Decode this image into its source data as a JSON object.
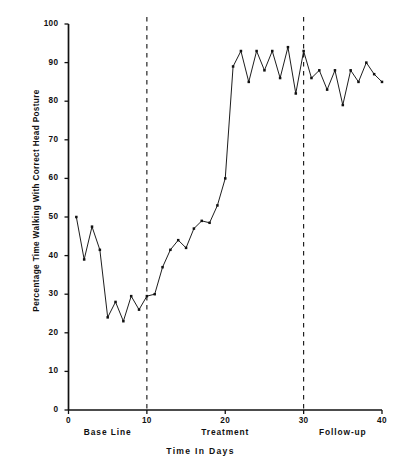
{
  "chart_data": {
    "type": "line",
    "title": "",
    "xlabel": "Time In Days",
    "ylabel": "Percentage Time Walking With Correct Head Posture",
    "xlim": [
      0,
      40
    ],
    "ylim": [
      0,
      100
    ],
    "xticks": [
      0,
      10,
      20,
      30,
      40
    ],
    "yticks": [
      0,
      10,
      20,
      30,
      40,
      50,
      60,
      70,
      80,
      90,
      100
    ],
    "grid": false,
    "legend": null,
    "line_color": "#111111",
    "marker": "square",
    "phases": [
      {
        "name": "Base Line",
        "label": "Base Line",
        "x_start": 0,
        "x_end": 10,
        "center": 5
      },
      {
        "name": "Treatment",
        "label": "Treatment",
        "x_start": 10,
        "x_end": 30,
        "center": 20
      },
      {
        "name": "Follow-up",
        "label": "Follow-up",
        "x_start": 30,
        "x_end": 40,
        "center": 35
      }
    ],
    "phase_dividers": [
      10,
      30
    ],
    "series": [
      {
        "name": "Percentage time walking with correct head posture",
        "x": [
          1,
          2,
          3,
          4,
          5,
          6,
          7,
          8,
          9,
          10,
          11,
          12,
          13,
          14,
          15,
          16,
          17,
          18,
          19,
          20,
          21,
          22,
          23,
          24,
          25,
          26,
          27,
          28,
          29,
          30,
          31,
          32,
          33,
          34,
          35,
          36,
          37,
          38,
          39,
          40
        ],
        "values": [
          50,
          39,
          47.5,
          41.5,
          24,
          28,
          23,
          29.5,
          26,
          29.5,
          30,
          37,
          41.5,
          44,
          42,
          47,
          49,
          48.5,
          53,
          60,
          89,
          93,
          85,
          93,
          88,
          93,
          86,
          94,
          82,
          93,
          86,
          88,
          83,
          88,
          79,
          88,
          85,
          90,
          87,
          85
        ],
        "color": "#111111"
      }
    ]
  },
  "axis": {
    "y_tick_labels": [
      "0",
      "10",
      "20",
      "30",
      "40",
      "50",
      "60",
      "70",
      "80",
      "90",
      "100"
    ],
    "x_tick_labels": [
      "0",
      "10",
      "20",
      "30",
      "40"
    ],
    "x_axis_title": "Time In Days",
    "y_axis_title": "Percentage Time Walking With Correct Head Posture"
  },
  "phase_labels": {
    "baseline": "Base Line",
    "treatment": "Treatment",
    "followup": "Follow-up"
  }
}
